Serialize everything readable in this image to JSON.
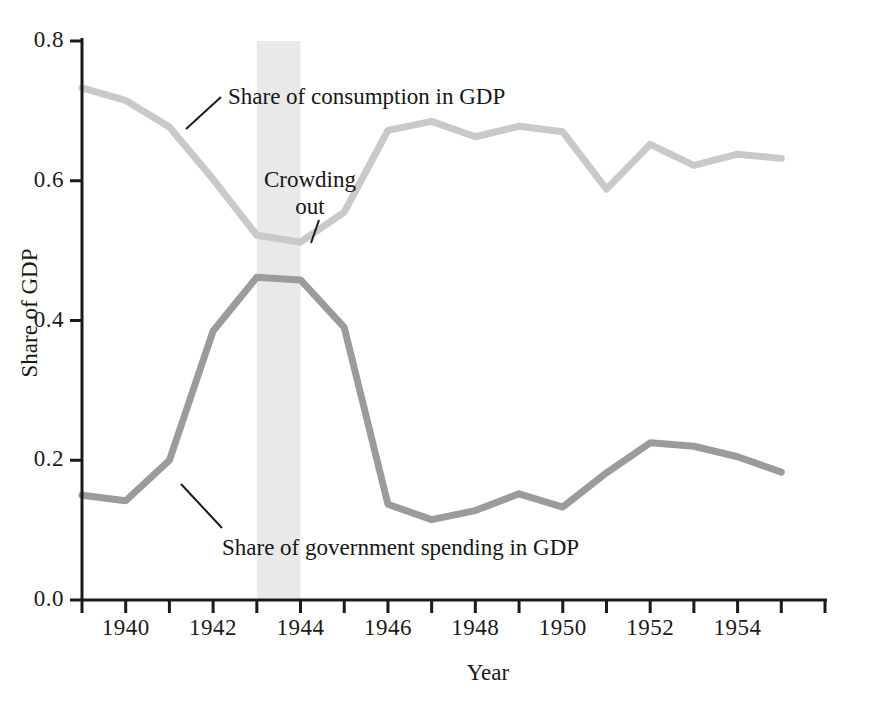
{
  "chart_data": {
    "type": "line",
    "title": "",
    "xlabel": "Year",
    "ylabel": "Share of GDP",
    "xlim": [
      1939,
      1956
    ],
    "ylim": [
      0.0,
      0.8
    ],
    "grid": false,
    "legend_position": "inline-annotations",
    "x": [
      1939,
      1940,
      1941,
      1942,
      1943,
      1944,
      1945,
      1946,
      1947,
      1948,
      1949,
      1950,
      1951,
      1952,
      1953,
      1954,
      1955
    ],
    "series": [
      {
        "name": "Share of consumption in GDP",
        "color": "#c9c9c9",
        "values": [
          0.733,
          0.715,
          0.677,
          0.602,
          0.522,
          0.512,
          0.555,
          0.672,
          0.685,
          0.663,
          0.678,
          0.67,
          0.588,
          0.652,
          0.622,
          0.638,
          0.632
        ]
      },
      {
        "name": "Share of government spending in GDP",
        "color": "#9b9b9b",
        "values": [
          0.15,
          0.142,
          0.2,
          0.385,
          0.462,
          0.458,
          0.39,
          0.137,
          0.115,
          0.128,
          0.152,
          0.133,
          0.182,
          0.225,
          0.22,
          0.205,
          0.183
        ]
      }
    ],
    "x_tick_values": [
      1939,
      1940,
      1941,
      1942,
      1943,
      1944,
      1945,
      1946,
      1947,
      1948,
      1949,
      1950,
      1951,
      1952,
      1953,
      1954,
      1955,
      1956
    ],
    "x_tick_labels": [
      "1940",
      "1942",
      "1944",
      "1946",
      "1948",
      "1950",
      "1952",
      "1954"
    ],
    "x_tick_label_values": [
      1940,
      1942,
      1944,
      1946,
      1948,
      1950,
      1952,
      1954
    ],
    "y_tick_labels": [
      "0.0",
      "0.2",
      "0.4",
      "0.6",
      "0.8"
    ],
    "y_tick_values": [
      0.0,
      0.2,
      0.4,
      0.6,
      0.8
    ],
    "shaded_band": {
      "label": "Crowding out",
      "label_line1": "Crowding",
      "label_line2": "out",
      "x_start": 1943,
      "x_end": 1944,
      "color": "#e9e9e9"
    },
    "annotations": [
      {
        "text": "Share of consumption in GDP",
        "x": 1942.3,
        "y": 0.72
      },
      {
        "text": "Crowding",
        "x": 1943.5,
        "y": 0.608
      },
      {
        "text": "out",
        "x": 1943.5,
        "y": 0.573
      },
      {
        "text": "Share of government spending in GDP",
        "x": 1942.2,
        "y": 0.108
      }
    ]
  },
  "axis": {
    "y_ticks": [
      "0.0",
      "0.2",
      "0.4",
      "0.6",
      "0.8"
    ],
    "x_ticks": [
      "1940",
      "1942",
      "1944",
      "1946",
      "1948",
      "1950",
      "1952",
      "1954"
    ],
    "x_title": "Year",
    "y_title": "Share of GDP"
  },
  "labels": {
    "consumption": "Share of consumption in GDP",
    "government": "Share of government spending in GDP",
    "crowding_line1": "Crowding",
    "crowding_line2": "out"
  }
}
